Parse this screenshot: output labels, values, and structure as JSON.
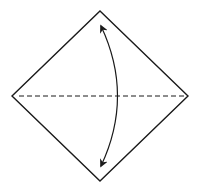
{
  "diagram": {
    "type": "origami-fold-instruction",
    "elements": {
      "paper": {
        "shape": "diamond",
        "label": ""
      },
      "fold_line": {
        "style": "dashed",
        "kind": "valley-fold",
        "orientation": "horizontal-diagonal"
      },
      "fold_arrow": {
        "kind": "fold-and-unfold",
        "heads": "both",
        "from": "top-corner",
        "to": "bottom-corner"
      }
    },
    "colors": {
      "stroke": "#1a1a1a",
      "background": "#ffffff"
    }
  }
}
